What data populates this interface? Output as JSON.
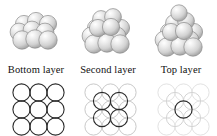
{
  "figure": {
    "background_color": "#ffffff",
    "width": 217,
    "height": 136
  },
  "colors": {
    "sphere_fill_light": "#f2f2f2",
    "sphere_fill_mid": "#d8d8d8",
    "sphere_fill_shadow": "#b4b4b4",
    "sphere_outline": "#8c8c8c",
    "circle_dark_stroke": "#2b2b2b",
    "circle_faint_stroke": "#c9c9c9",
    "circle_ghost_stroke": "#dedede",
    "caption_text": "#111111"
  },
  "panels": [
    {
      "id": "bottom",
      "caption": "Bottom layer",
      "stack": {
        "description": "single flat 3x3 array of spheres",
        "layer_count": 1,
        "sphere_count": 9,
        "rows": [
          3,
          3,
          3
        ]
      },
      "packing": {
        "description": "3x3 square grid of touching circles, all drawn dark",
        "dark_circles": 9,
        "faint_circles": 0,
        "dark_circle_role": "bottom-layer spheres",
        "grid": "3x3"
      }
    },
    {
      "id": "second",
      "caption": "Second layer",
      "stack": {
        "description": "3x3 bottom layer with 2x2 spheres nested in the hollows above",
        "layer_count": 2,
        "sphere_count": 13,
        "rows": [
          3,
          3,
          3
        ]
      },
      "packing": {
        "description": "faint 3x3 bottom grid with 4 dark circles seated in the interstices",
        "dark_circles": 4,
        "faint_circles": 9,
        "dark_circle_role": "second-layer spheres",
        "grid": "2x2 offset"
      }
    },
    {
      "id": "top",
      "caption": "Top layer",
      "stack": {
        "description": "3x3 bottom layer, 2x2 second layer and one sphere capping the pyramid",
        "layer_count": 3,
        "sphere_count": 14,
        "rows": [
          3,
          3,
          3
        ]
      },
      "packing": {
        "description": "ghosted lower grids with one dark circle at the centre",
        "dark_circles": 1,
        "faint_circles": 13,
        "dark_circle_role": "top-layer sphere",
        "grid": "1 centre"
      }
    }
  ]
}
